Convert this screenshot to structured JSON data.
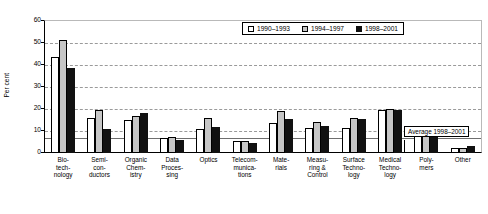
{
  "chart_data": {
    "type": "bar",
    "title": "",
    "xlabel": "",
    "ylabel": "Per cent",
    "ylim": [
      0,
      60
    ],
    "yticks": [
      0,
      10,
      20,
      30,
      40,
      50,
      60
    ],
    "grid": true,
    "legend_position": "top-right",
    "categories": [
      "Bio-\ntech-\nnology",
      "Semi-\ncon-\nductors",
      "Organic\nChem-\nistry",
      "Data\nProces-\nsing",
      "Optics",
      "Telecom-\nmunica-\ntions",
      "Mate-\nrials",
      "Measu-\nring &\nControl",
      "Surface\nTechno-\nlogy",
      "Medical\nTechno-\nlogy",
      "Poly-\nmers",
      "Other"
    ],
    "series": [
      {
        "name": "1990–1993",
        "color": "#ffffff",
        "values": [
          43.5,
          16.0,
          15.0,
          7.0,
          11.0,
          5.5,
          13.5,
          11.5,
          11.5,
          19.5,
          8.5,
          2.5
        ]
      },
      {
        "name": "1994–1997",
        "color": "#c6c6c6",
        "values": [
          51.5,
          19.5,
          17.0,
          7.5,
          16.0,
          5.5,
          19.0,
          14.0,
          16.0,
          20.0,
          10.5,
          2.5
        ]
      },
      {
        "name": "1998–2001",
        "color": "#111111",
        "values": [
          38.5,
          11.0,
          18.0,
          6.0,
          12.0,
          4.5,
          15.5,
          12.5,
          15.5,
          19.5,
          8.0,
          3.0
        ]
      }
    ],
    "reference_line": {
      "label": "Average 1998–2001",
      "value": 6.8
    }
  },
  "legend": {
    "items": [
      {
        "label": "1990–1993"
      },
      {
        "label": "1994–1997"
      },
      {
        "label": "1998–2001"
      }
    ]
  },
  "annotation": {
    "label": "Average 1998–2001"
  }
}
